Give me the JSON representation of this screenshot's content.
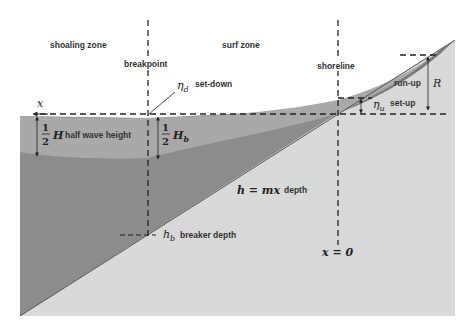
{
  "diagram": {
    "zones": {
      "shoaling": "shoaling zone",
      "surf": "surf zone"
    },
    "lines": {
      "breakpoint": "breakpoint",
      "shoreline": "shoreline"
    },
    "annotations": {
      "x_axis": "x",
      "set_down_symbol": "η",
      "set_down_sub": "d",
      "set_down_label": "set-down",
      "half_wave_num": "1",
      "half_wave_den": "2",
      "half_wave_symbol": "H",
      "half_wave_label": "half wave height",
      "half_wave_b_symbol": "H",
      "half_wave_b_sub": "b",
      "depth_eq": "h = mx",
      "depth_label": "depth",
      "breaker_symbol": "h",
      "breaker_sub": "b",
      "breaker_label": "breaker depth",
      "origin": "x = 0",
      "run_up_label": "run-up",
      "run_up_symbol": "R",
      "set_up_symbol": "η",
      "set_up_sub": "u",
      "set_up_label": "set-up"
    },
    "colors": {
      "beach": "#d9d9d9",
      "water_deep": "#8a8a8a",
      "wave_band": "#a8a8a8",
      "swash": "#7d7d7d",
      "lines": "#222222"
    }
  }
}
